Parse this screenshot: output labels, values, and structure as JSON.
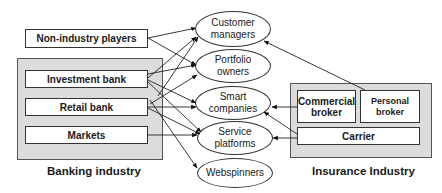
{
  "diagram": {
    "banking": {
      "label": "Banking industry",
      "items": [
        "Investment bank",
        "Retail bank",
        "Markets"
      ]
    },
    "non_industry": "Non-industry players",
    "insurance": {
      "label": "Insurance Industry",
      "items": [
        "Commercial broker",
        "Personal broker",
        "Carrier"
      ]
    },
    "roles": [
      "Customer managers",
      "Portfolio owners",
      "Smart companies",
      "Service platforms",
      "Webspinners"
    ],
    "edges": [
      [
        "Non-industry players",
        "Customer managers"
      ],
      [
        "Non-industry players",
        "Portfolio owners"
      ],
      [
        "Investment bank",
        "Customer managers"
      ],
      [
        "Investment bank",
        "Portfolio owners"
      ],
      [
        "Investment bank",
        "Smart companies"
      ],
      [
        "Investment bank",
        "Service platforms"
      ],
      [
        "Retail bank",
        "Customer managers"
      ],
      [
        "Retail bank",
        "Portfolio owners"
      ],
      [
        "Retail bank",
        "Smart companies"
      ],
      [
        "Retail bank",
        "Service platforms"
      ],
      [
        "Retail bank",
        "Webspinners"
      ],
      [
        "Markets",
        "Service platforms"
      ],
      [
        "Commercial broker",
        "Smart companies"
      ],
      [
        "Carrier",
        "Smart companies"
      ],
      [
        "Carrier",
        "Service platforms"
      ],
      [
        "Personal broker",
        "Customer managers"
      ]
    ]
  }
}
